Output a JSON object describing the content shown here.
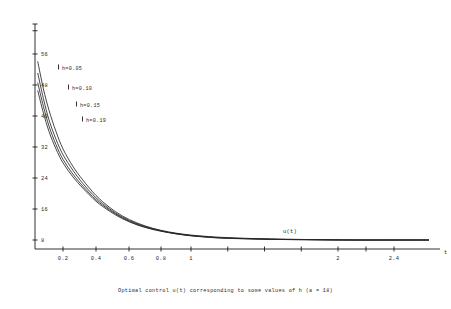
{
  "chart_data": {
    "type": "line",
    "title": "",
    "caption": "Optimal control u(t) corresponding to some values of h  (a = 18)",
    "xlabel": "t",
    "ylabel": "",
    "curve_annotation": "u(t)",
    "xticks": [
      "0.2",
      "0.4",
      "0.6",
      "0.8",
      "1",
      "2",
      "2.4"
    ],
    "xtick_values": [
      0.2,
      0.4,
      0.6,
      0.8,
      1.0,
      2.0,
      2.4
    ],
    "yticks": [
      "56",
      "48",
      "40",
      "32",
      "24",
      "16",
      "8"
    ],
    "ytick_values": [
      56,
      48,
      40,
      32,
      24,
      16,
      8
    ],
    "xlim": [
      0,
      2.6
    ],
    "ylim": [
      0,
      62
    ],
    "grid": false,
    "legend_position": "inline-annotations",
    "series": [
      {
        "name": "h=0.05",
        "label": "h=0.05",
        "x": [
          0.02,
          0.06,
          0.1,
          0.15,
          0.2,
          0.26,
          0.32,
          0.4,
          0.48,
          0.56,
          0.65,
          0.75,
          0.85,
          0.95,
          1.05,
          1.2,
          1.4,
          1.6,
          1.85,
          2.1,
          2.4,
          2.55
        ],
        "y": [
          54.0,
          47.0,
          41.5,
          36.0,
          31.5,
          27.0,
          23.5,
          19.5,
          16.5,
          14.2,
          12.4,
          11.0,
          10.1,
          9.5,
          9.1,
          8.7,
          8.4,
          8.2,
          8.1,
          8.0,
          8.0,
          8.0
        ]
      },
      {
        "name": "h=0.10",
        "label": "h=0.10",
        "x": [
          0.02,
          0.06,
          0.1,
          0.15,
          0.2,
          0.26,
          0.32,
          0.4,
          0.48,
          0.56,
          0.65,
          0.75,
          0.85,
          0.95,
          1.05,
          1.2,
          1.4,
          1.6,
          1.85,
          2.1,
          2.4,
          2.55
        ],
        "y": [
          51.0,
          44.5,
          39.0,
          34.0,
          30.0,
          26.0,
          22.6,
          18.9,
          16.1,
          13.9,
          12.2,
          10.9,
          10.0,
          9.4,
          9.0,
          8.6,
          8.35,
          8.2,
          8.1,
          8.0,
          8.0,
          8.0
        ]
      },
      {
        "name": "h=0.15",
        "label": "h=0.15",
        "x": [
          0.02,
          0.06,
          0.1,
          0.15,
          0.2,
          0.26,
          0.32,
          0.4,
          0.48,
          0.56,
          0.65,
          0.75,
          0.85,
          0.95,
          1.05,
          1.2,
          1.4,
          1.6,
          1.85,
          2.1,
          2.4,
          2.55
        ],
        "y": [
          48.5,
          42.5,
          37.4,
          32.6,
          28.8,
          25.0,
          21.9,
          18.4,
          15.8,
          13.7,
          12.0,
          10.8,
          9.95,
          9.35,
          8.95,
          8.55,
          8.3,
          8.15,
          8.05,
          8.0,
          8.0,
          8.0
        ]
      },
      {
        "name": "h=0.19",
        "label": "h=0.19",
        "x": [
          0.02,
          0.06,
          0.1,
          0.15,
          0.2,
          0.26,
          0.32,
          0.4,
          0.48,
          0.56,
          0.65,
          0.75,
          0.85,
          0.95,
          1.05,
          1.2,
          1.4,
          1.6,
          1.85,
          2.1,
          2.4,
          2.55
        ],
        "y": [
          46.5,
          40.8,
          36.0,
          31.5,
          27.9,
          24.3,
          21.4,
          18.0,
          15.5,
          13.5,
          11.9,
          10.7,
          9.9,
          9.3,
          8.9,
          8.5,
          8.28,
          8.14,
          8.04,
          8.0,
          8.0,
          8.0
        ]
      }
    ],
    "annotations": [
      {
        "text": "h=0.05",
        "x_px": 62,
        "y_px": 70
      },
      {
        "text": "h=0.10",
        "x_px": 72,
        "y_px": 90
      },
      {
        "text": "h=0.15",
        "x_px": 80,
        "y_px": 107
      },
      {
        "text": "h=0.19",
        "x_px": 86,
        "y_px": 122
      },
      {
        "text": "u(t)",
        "x_px": 283,
        "y_px": 233
      },
      {
        "text": "t",
        "x_px": 444,
        "y_px": 254
      }
    ]
  }
}
